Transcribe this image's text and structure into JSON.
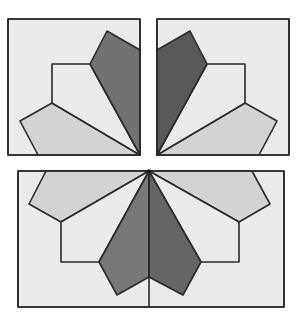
{
  "figure": {
    "colors": {
      "background": "#ebebeb",
      "light_piece": "#d3d3d3",
      "medium_dark_piece": "#737373",
      "dark_piece": "#5f5f5f",
      "outline": "#2a2a2a"
    },
    "blocks": [
      {
        "name": "top-left-square",
        "x": 8,
        "y": 19,
        "w": 132,
        "h": 136
      },
      {
        "name": "top-right-square",
        "x": 157,
        "y": 19,
        "w": 132,
        "h": 136
      },
      {
        "name": "bottom-rectangle",
        "x": 18,
        "y": 171,
        "w": 266,
        "h": 136
      }
    ]
  }
}
